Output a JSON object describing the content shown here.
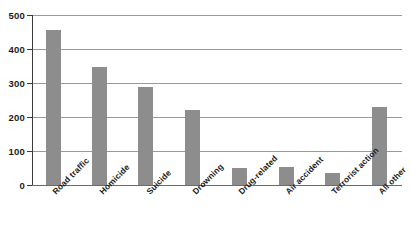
{
  "chart_data": {
    "type": "bar",
    "title": "",
    "subtitle": "",
    "xlabel": "",
    "ylabel": "",
    "categories": [
      "Road traffic",
      "Homicide",
      "Suicide",
      "Drowning",
      "Drug-related",
      "Air accident",
      "Terrorist action",
      "All other"
    ],
    "values": [
      455,
      348,
      287,
      222,
      50,
      53,
      36,
      230
    ],
    "ylim": [
      0,
      500
    ],
    "yticks": [
      0,
      100,
      200,
      300,
      400,
      500
    ],
    "ytick_labels": [
      "0",
      "100",
      "200",
      "300",
      "400",
      "500"
    ],
    "grid": "horizontal",
    "legend": "none",
    "bar_color": "#8d8d8d",
    "gridline_color": "#9a9a9a",
    "axis_color": "#3c3c3c",
    "background_color": "#ffffff"
  }
}
